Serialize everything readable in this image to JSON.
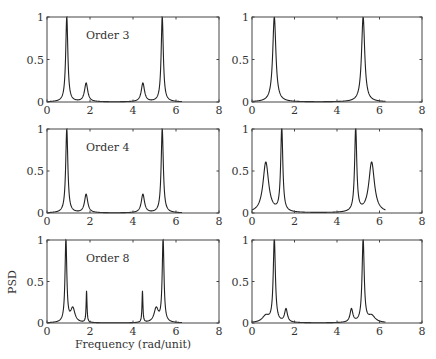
{
  "chart_data": {
    "type": "line",
    "layout": {
      "rows": 3,
      "cols": 2,
      "grid": false,
      "legend": "none"
    },
    "xlabel": "Frequency (rad/unit)",
    "ylabel": "PSD",
    "xlim": [
      0,
      8
    ],
    "ylim": [
      0,
      1
    ],
    "xticks": [
      0,
      2,
      4,
      6,
      8
    ],
    "yticks": [
      0,
      0.5,
      1
    ],
    "ytick_labels": [
      "0",
      "0.5",
      "1"
    ],
    "x_range_of_curves": [
      0,
      6.28
    ],
    "panels": [
      {
        "row": 0,
        "col": 0,
        "annotation": "Order 3",
        "peaks": [
          {
            "x": 0.92,
            "h": 1.0,
            "w": 0.06
          },
          {
            "x": 1.82,
            "h": 0.22,
            "w": 0.09
          },
          {
            "x": 4.46,
            "h": 0.22,
            "w": 0.09
          },
          {
            "x": 5.36,
            "h": 1.0,
            "w": 0.06
          }
        ],
        "baseline": 0.0
      },
      {
        "row": 0,
        "col": 1,
        "annotation": "",
        "peaks": [
          {
            "x": 1.05,
            "h": 1.0,
            "w": 0.09
          },
          {
            "x": 5.23,
            "h": 1.0,
            "w": 0.09
          }
        ],
        "baseline": 0.0
      },
      {
        "row": 1,
        "col": 0,
        "annotation": "Order 4",
        "peaks": [
          {
            "x": 0.92,
            "h": 1.0,
            "w": 0.06
          },
          {
            "x": 1.82,
            "h": 0.22,
            "w": 0.09
          },
          {
            "x": 4.46,
            "h": 0.22,
            "w": 0.09
          },
          {
            "x": 5.36,
            "h": 1.0,
            "w": 0.06
          }
        ],
        "baseline": 0.0
      },
      {
        "row": 1,
        "col": 1,
        "annotation": "",
        "peaks": [
          {
            "x": 0.65,
            "h": 0.6,
            "w": 0.16
          },
          {
            "x": 1.4,
            "h": 1.0,
            "w": 0.06
          },
          {
            "x": 4.88,
            "h": 1.0,
            "w": 0.06
          },
          {
            "x": 5.63,
            "h": 0.6,
            "w": 0.16
          }
        ],
        "baseline": 0.0
      },
      {
        "row": 2,
        "col": 0,
        "annotation": "Order 8",
        "peaks": [
          {
            "x": 0.88,
            "h": 1.0,
            "w": 0.05
          },
          {
            "x": 1.2,
            "h": 0.17,
            "w": 0.12
          },
          {
            "x": 1.84,
            "h": 0.38,
            "w": 0.025
          },
          {
            "x": 4.44,
            "h": 0.38,
            "w": 0.025
          },
          {
            "x": 5.08,
            "h": 0.17,
            "w": 0.12
          },
          {
            "x": 5.4,
            "h": 1.0,
            "w": 0.05
          }
        ],
        "baseline": 0.0
      },
      {
        "row": 2,
        "col": 1,
        "annotation": "",
        "peaks": [
          {
            "x": 0.65,
            "h": 0.08,
            "w": 0.2
          },
          {
            "x": 1.05,
            "h": 1.0,
            "w": 0.06
          },
          {
            "x": 1.6,
            "h": 0.16,
            "w": 0.08
          },
          {
            "x": 4.68,
            "h": 0.16,
            "w": 0.08
          },
          {
            "x": 5.23,
            "h": 1.0,
            "w": 0.06
          },
          {
            "x": 5.63,
            "h": 0.08,
            "w": 0.2
          }
        ],
        "baseline": 0.0
      }
    ]
  },
  "panel_geometry": {
    "cols": [
      {
        "x0": 47,
        "x1": 219
      },
      {
        "x0": 252,
        "x1": 422
      }
    ],
    "rows": [
      {
        "y0": 17,
        "y1": 102
      },
      {
        "y0": 129,
        "y1": 213
      },
      {
        "y0": 240,
        "y1": 323
      }
    ]
  },
  "line_color": "#222222",
  "axis_color": "#444444"
}
